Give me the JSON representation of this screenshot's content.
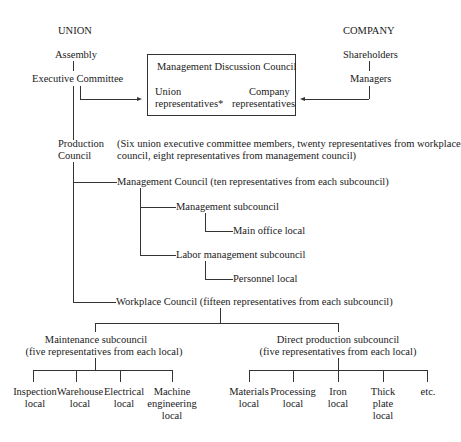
{
  "union": {
    "heading": "UNION",
    "assembly": "Assembly",
    "executive_committee": "Executive Committee"
  },
  "company": {
    "heading": "COMPANY",
    "shareholders": "Shareholders",
    "managers": "Managers"
  },
  "discussion_council": {
    "title": "Management Discussion Council",
    "union_reps_line1": "Union",
    "union_reps_line2": "representatives*",
    "company_reps_line1": "Company",
    "company_reps_line2": "representatives"
  },
  "production_council": {
    "label_line1": "Production",
    "label_line2": "Council",
    "note_line1": "(Six union executive committee members, twenty representatives from workplace",
    "note_line2": "council, eight representatives from management council)"
  },
  "management_council": {
    "label": "Management Council (ten representatives from each subcouncil)",
    "management_subcouncil": "Management subcouncil",
    "main_office_local": "Main office local",
    "labor_management_subcouncil": "Labor management subcouncil",
    "personnel_local": "Personnel local"
  },
  "workplace_council": {
    "label": "Workplace Council (fifteen representatives from each subcouncil)",
    "maintenance": {
      "line1": "Maintenance subcouncil",
      "line2": "(five representatives from each local)",
      "locals": [
        {
          "l1": "Inspection",
          "l2": "local",
          "l3": ""
        },
        {
          "l1": "Warehouse",
          "l2": "local",
          "l3": ""
        },
        {
          "l1": "Electrical",
          "l2": "local",
          "l3": ""
        },
        {
          "l1": "Machine",
          "l2": "engineering",
          "l3": "local"
        }
      ]
    },
    "direct_production": {
      "line1": "Direct production subcouncil",
      "line2": "(five representatives from each local)",
      "locals": [
        {
          "l1": "Materials",
          "l2": "local",
          "l3": ""
        },
        {
          "l1": "Processing",
          "l2": "local",
          "l3": ""
        },
        {
          "l1": "Iron",
          "l2": "local",
          "l3": ""
        },
        {
          "l1": "Thick",
          "l2": "plate",
          "l3": "local"
        },
        {
          "l1": "etc.",
          "l2": "",
          "l3": ""
        }
      ]
    }
  }
}
